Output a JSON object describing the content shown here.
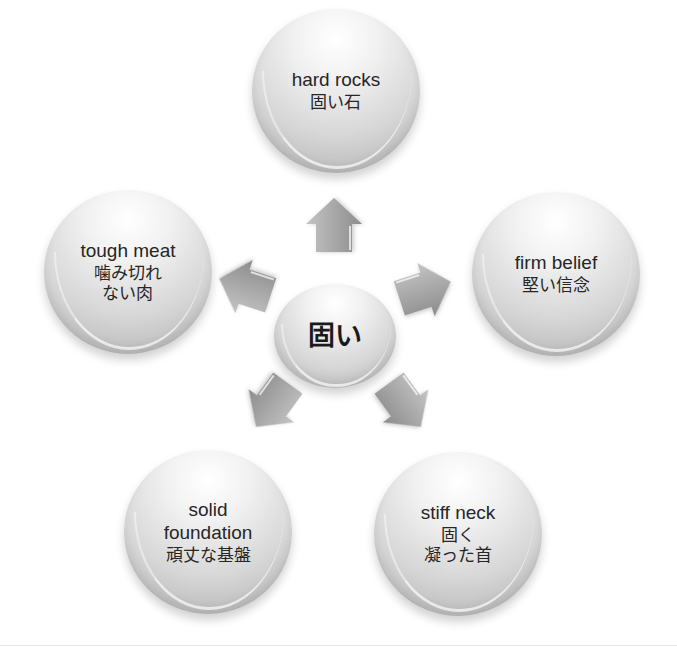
{
  "diagram": {
    "type": "radial-cycle",
    "center": {
      "label": "固い"
    },
    "nodes": [
      {
        "id": "top",
        "en": "hard rocks",
        "jp": "固い石",
        "jp2": ""
      },
      {
        "id": "right",
        "en": "firm belief",
        "jp": "堅い信念",
        "jp2": ""
      },
      {
        "id": "bottom-right",
        "en": "stiff neck",
        "jp": "固く",
        "jp2": "凝った首"
      },
      {
        "id": "bottom-left",
        "en": "solid",
        "en2": "foundation",
        "jp": "頑丈な基盤"
      },
      {
        "id": "left",
        "en": "tough meat",
        "jp": "噛み切れ",
        "jp2": "ない肉"
      }
    ],
    "arrows": [
      {
        "direction": "up",
        "angle": -90
      },
      {
        "direction": "upper-right",
        "angle": -18
      },
      {
        "direction": "lower-right",
        "angle": 54
      },
      {
        "direction": "lower-left",
        "angle": 126
      },
      {
        "direction": "upper-left",
        "angle": 198
      }
    ],
    "colors": {
      "bubble_light": "#f2f2f2",
      "bubble_dark": "#a9a9a9",
      "arrow_fill": "#9e9e9e",
      "text": "#262626"
    }
  }
}
